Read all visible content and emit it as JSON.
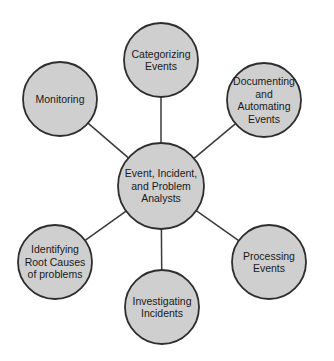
{
  "diagram": {
    "type": "hub-and-spoke",
    "colors": {
      "node_fill": "#cfcfcf",
      "node_stroke": "#2e2e2e",
      "connector": "#3a3a3a",
      "text": "#1a1a1a",
      "background": "#ffffff"
    },
    "hub": {
      "id": "hub",
      "lines": [
        "Event, Incident,",
        "and Problem",
        "Analysts"
      ]
    },
    "nodes": [
      {
        "id": "categorizing-events",
        "lines": [
          "Categorizing",
          "Events"
        ]
      },
      {
        "id": "documenting-and-automating-events",
        "lines": [
          "Documenting",
          "and",
          "Automating",
          "Events"
        ]
      },
      {
        "id": "processing-events",
        "lines": [
          "Processing",
          "Events"
        ]
      },
      {
        "id": "investigating-incidents",
        "lines": [
          "Investigating",
          "Incidents"
        ]
      },
      {
        "id": "identifying-root-causes",
        "lines": [
          "Identifying",
          "Root Causes",
          "of problems"
        ]
      },
      {
        "id": "monitoring",
        "lines": [
          "Monitoring"
        ]
      }
    ],
    "edges": [
      {
        "from": "hub",
        "to": "categorizing-events"
      },
      {
        "from": "hub",
        "to": "documenting-and-automating-events"
      },
      {
        "from": "hub",
        "to": "processing-events"
      },
      {
        "from": "hub",
        "to": "investigating-incidents"
      },
      {
        "from": "hub",
        "to": "identifying-root-causes"
      },
      {
        "from": "hub",
        "to": "monitoring"
      }
    ]
  }
}
